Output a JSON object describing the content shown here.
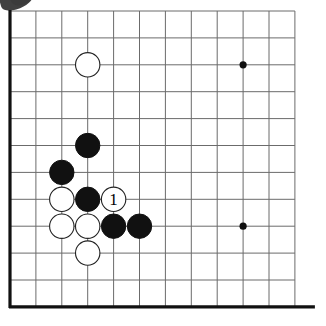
{
  "figure": {
    "kind": "go-board-diagram",
    "board": {
      "edges_shown": [
        "left",
        "bottom"
      ],
      "origin_x": 10,
      "origin_y": 11,
      "spacing_x": 25.9,
      "spacing_y": 26.9,
      "columns": 12,
      "rows": 12,
      "grid_color": "#6b6b6b",
      "edge_color": "#111111",
      "grid_line_width": 1.0,
      "edge_line_width": 3.2,
      "background_color": "#ffffff"
    },
    "star_points": [
      {
        "name": "star-point-upper-right",
        "col": 9,
        "row": 2
      },
      {
        "name": "star-point-lower-right",
        "col": 9,
        "row": 8
      }
    ],
    "star_point_radius": 3.6,
    "stone_radius": 12.2,
    "colors": {
      "black_stone": "#111111",
      "white_stone": "#ffffff",
      "white_stone_outline": "#222222",
      "star_point": "#111111"
    },
    "stones": [
      {
        "name": "white-stone-c3-r2",
        "color": "white",
        "col": 3,
        "row": 2,
        "label": ""
      },
      {
        "name": "black-stone-c3-r5",
        "color": "black",
        "col": 3,
        "row": 5,
        "label": ""
      },
      {
        "name": "black-stone-c2-r6",
        "color": "black",
        "col": 2,
        "row": 6,
        "label": ""
      },
      {
        "name": "white-stone-c2-r7",
        "color": "white",
        "col": 2,
        "row": 7,
        "label": ""
      },
      {
        "name": "black-stone-c3-r7",
        "color": "black",
        "col": 3,
        "row": 7,
        "label": ""
      },
      {
        "name": "white-stone-move-1",
        "color": "white",
        "col": 4,
        "row": 7,
        "label": "1"
      },
      {
        "name": "white-stone-c2-r8",
        "color": "white",
        "col": 2,
        "row": 8,
        "label": ""
      },
      {
        "name": "white-stone-c3-r8",
        "color": "white",
        "col": 3,
        "row": 8,
        "label": ""
      },
      {
        "name": "black-stone-c4-r8",
        "color": "black",
        "col": 4,
        "row": 8,
        "label": ""
      },
      {
        "name": "black-stone-c5-r8",
        "color": "black",
        "col": 5,
        "row": 8,
        "label": ""
      },
      {
        "name": "white-stone-c3-r9",
        "color": "white",
        "col": 3,
        "row": 9,
        "label": ""
      }
    ],
    "move_labels": [
      {
        "name": "move-number-1",
        "text": "1",
        "col": 4,
        "row": 7
      }
    ]
  }
}
